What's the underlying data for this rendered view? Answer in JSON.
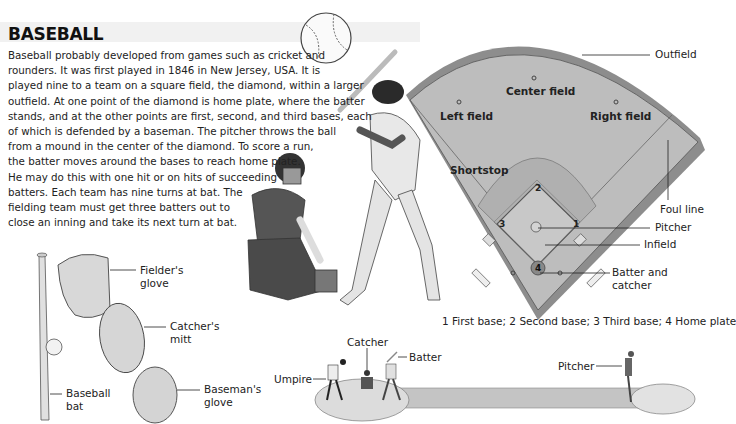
{
  "header": {
    "title": "BASEBALL"
  },
  "intro": {
    "lines": [
      "Baseball probably developed from games such as cricket and",
      "rounders. It was first played in 1846 in New Jersey, USA. It is",
      "played nine to a team on a square field, the diamond, within a larger",
      "outfield. At one point of the diamond is home plate, where the batter",
      "stands, and at the other points are first, second, and third bases, each",
      "of which is defended by a baseman. The pitcher throws the ball",
      "from a mound in the center of the diamond. To score a run,",
      "the batter moves around the bases to reach home plate.",
      "He may do this with one hit or on hits of succeeding",
      "batters. Each team has nine turns at bat. The",
      "fielding team must get three batters out to",
      "close an inning and take its next turn at bat."
    ]
  },
  "equipment": {
    "fielders_glove": [
      "Fielder's",
      "glove"
    ],
    "catchers_mitt": [
      "Catcher's",
      "mitt"
    ],
    "basemans_glove": [
      "Baseman's",
      "glove"
    ],
    "bat": [
      "Baseball",
      "bat"
    ]
  },
  "field": {
    "outfield": "Outfield",
    "center_field": "Center field",
    "left_field": "Left field",
    "right_field": "Right field",
    "shortstop": "Shortstop",
    "foul_line": "Foul line",
    "pitcher": "Pitcher",
    "infield": "Infield",
    "batter_catcher": [
      "Batter and",
      "catcher"
    ],
    "bases": [
      "1",
      "2",
      "3",
      "4"
    ],
    "caption": "1 First base; 2 Second base; 3 Third base; 4 Home plate",
    "colors": {
      "grass": "#b9b9b9",
      "infield": "#c9c9c9",
      "wall": "#8a8a8a"
    }
  },
  "side_view": {
    "umpire": "Umpire",
    "catcher": "Catcher",
    "batter": "Batter",
    "pitcher": "Pitcher"
  }
}
